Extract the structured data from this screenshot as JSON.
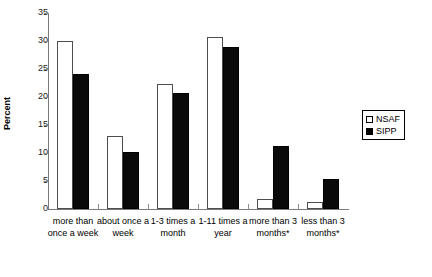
{
  "chart_data": {
    "type": "bar",
    "title": "",
    "subtitle": "",
    "xlabel": "",
    "ylabel": "Percent",
    "ylim": [
      0,
      35
    ],
    "yticks": [
      0,
      5,
      10,
      15,
      20,
      25,
      30,
      35
    ],
    "ytick_labels": [
      "0",
      "5",
      "10",
      "15",
      "20",
      "25",
      "30",
      "35"
    ],
    "grid": false,
    "legend_position": "right",
    "categories": [
      "more than once a week",
      "about once a week",
      "1-3 times a month",
      "1-11 times a year",
      "more than 3 months*",
      "less than 3 months*"
    ],
    "category_lines": [
      [
        "more than",
        "once a week"
      ],
      [
        "about once a",
        "week"
      ],
      [
        "1-3 times a",
        "month"
      ],
      [
        "1-11 times a",
        "year"
      ],
      [
        "more than 3",
        "months*"
      ],
      [
        "less than 3",
        "months*"
      ]
    ],
    "series": [
      {
        "name": "NSAF",
        "color": "#ffffff",
        "edge_color": "#4d4d4d",
        "values": [
          30.0,
          13.0,
          22.4,
          30.7,
          1.7,
          1.2
        ]
      },
      {
        "name": "SIPP",
        "color": "#000000",
        "edge_color": "#000000",
        "values": [
          24.1,
          10.2,
          20.7,
          29.0,
          11.3,
          5.4
        ]
      }
    ]
  },
  "legend": {
    "items": [
      {
        "label": "NSAF",
        "swatch": "open-square"
      },
      {
        "label": "SIPP",
        "swatch": "filled-square"
      }
    ]
  },
  "axis": {
    "y_title": "Percent"
  }
}
